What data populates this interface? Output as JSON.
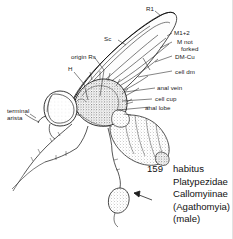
{
  "figure": {
    "number": "159",
    "caption_lines": [
      "habitus",
      "Platypezidae",
      "Callomyiinae",
      "(Agathomyia)",
      "(male)"
    ],
    "background_color": "#ffffff",
    "ink_color": "#1a1a1a"
  },
  "labels": {
    "r1": "R1",
    "sc": "Sc",
    "m1_2": "M1+2",
    "m_not_forked_1": "M not",
    "m_not_forked_2": "forked",
    "dm_cu": "DM-Cu",
    "cell_dm": "cell dm",
    "anal_vein": "anal vein",
    "cell_cup": "cell cup",
    "anal_lobe": "anal lobe",
    "origin_rs": "origin Rs",
    "h": "H",
    "terminal_arista_1": "terminal",
    "terminal_arista_2": "arista"
  },
  "illustration": {
    "subject": "fly-lateral-habitus",
    "technique": "stippled-line-drawing",
    "pointer": "arrow-to-hind-tarsus"
  }
}
